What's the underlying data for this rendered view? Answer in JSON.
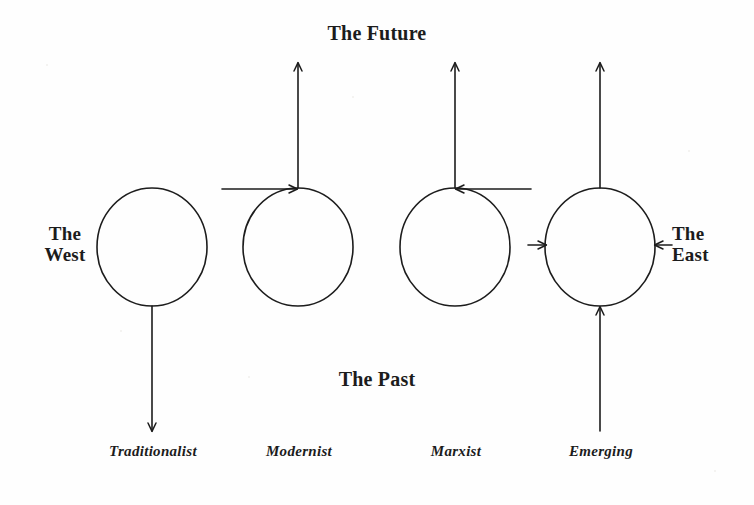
{
  "figure": {
    "background_color": "#fefefe",
    "ink_color": "#1c1c1c",
    "width": 754,
    "height": 505
  },
  "axis_labels": {
    "top": "The Future",
    "bottom": "The Past",
    "left": "The\nWest",
    "right": "The\nEast"
  },
  "nodes": [
    {
      "id": "traditionalist",
      "label": "Traditionalist",
      "cx": 152,
      "cy": 247,
      "rx": 55,
      "ry": 59
    },
    {
      "id": "modernist",
      "label": "Modernist",
      "cx": 298,
      "cy": 247,
      "rx": 55,
      "ry": 59
    },
    {
      "id": "marxist",
      "label": "Marxist",
      "cx": 455,
      "cy": 247,
      "rx": 55,
      "ry": 59
    },
    {
      "id": "emerging",
      "label": "Emerging",
      "cx": 600,
      "cy": 247,
      "rx": 55,
      "ry": 59
    }
  ],
  "arrows": [
    {
      "id": "traditionalist-down",
      "node": "traditionalist",
      "direction": "down",
      "description": "downward arrow from bottom of Traditionalist circle toward The Past"
    },
    {
      "id": "modernist-up",
      "node": "modernist",
      "direction": "up",
      "description": "upward arrow from top of Modernist circle toward The Future"
    },
    {
      "id": "modernist-from-west",
      "node": "modernist",
      "direction": "right",
      "description": "horizontal arrow from the West pointing right into top of Modernist circle"
    },
    {
      "id": "marxist-up",
      "node": "marxist",
      "direction": "up",
      "description": "upward arrow from top of Marxist circle toward The Future"
    },
    {
      "id": "marxist-from-east",
      "node": "marxist",
      "direction": "left",
      "description": "horizontal arrow from the East pointing left into top of Marxist circle"
    },
    {
      "id": "emerging-up",
      "node": "emerging",
      "direction": "up",
      "description": "upward arrow from top of Emerging circle toward The Future"
    },
    {
      "id": "emerging-from-past",
      "node": "emerging",
      "direction": "up",
      "description": "upward arrow from The Past into bottom of Emerging circle"
    },
    {
      "id": "emerging-from-west",
      "node": "emerging",
      "direction": "right",
      "description": "short arrow from the West pointing right into left side of Emerging circle"
    },
    {
      "id": "emerging-from-east",
      "node": "emerging",
      "direction": "left",
      "description": "short arrow from the East pointing left into right side of Emerging circle"
    }
  ]
}
